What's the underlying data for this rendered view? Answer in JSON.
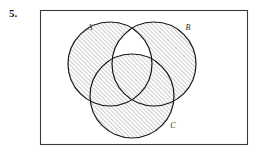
{
  "problem": {
    "number": "5."
  },
  "figure": {
    "name": "venn-diagram-three-sets",
    "frame": {
      "x": 40,
      "y": 10,
      "width": 208,
      "height": 135,
      "stroke_color": "#3a3a3a",
      "fill_color": "#ffffff"
    },
    "circles": [
      {
        "id": "A",
        "label": "A",
        "cx": 110,
        "cy": 64,
        "r": 42,
        "label_x": 90,
        "label_y": 30
      },
      {
        "id": "B",
        "label": "B",
        "cx": 154,
        "cy": 64,
        "r": 42,
        "label_x": 188,
        "label_y": 30
      },
      {
        "id": "C",
        "label": "C",
        "cx": 132,
        "cy": 96,
        "r": 42,
        "label_x": 173,
        "label_y": 128
      }
    ],
    "stroke_color": "#161616",
    "stroke_width": 1.2,
    "hatch": {
      "pattern": "diagonal-lines-45",
      "color": "#5a5a5a",
      "spacing": 3,
      "line_width": 0.6
    },
    "shaded_description": "All of A union B union C is hatched except the lens-shaped region of A intersect B that lies outside C.",
    "unshaded_regions": [
      "A-intersect-B-minus-C"
    ]
  }
}
